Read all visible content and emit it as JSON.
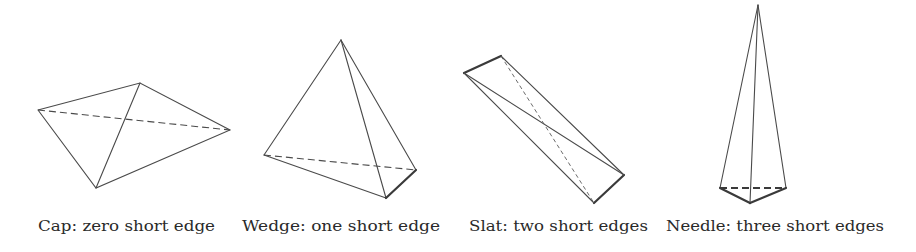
{
  "figure": {
    "panels": [
      {
        "id": "cap",
        "label": "Cap: zero short edge",
        "short_edges": 0,
        "vertices": {
          "A": [
            38,
            110
          ],
          "B": [
            140,
            83
          ],
          "C": [
            230,
            130
          ],
          "D": [
            96,
            188
          ]
        }
      },
      {
        "id": "wedge",
        "label": "Wedge: one short edge",
        "short_edges": 1,
        "vertices": {
          "apex": [
            341,
            40
          ],
          "left": [
            264,
            155
          ],
          "right": [
            416,
            170
          ],
          "bottom": [
            386,
            198
          ]
        }
      },
      {
        "id": "slat",
        "label": "Slat: two short edges",
        "short_edges": 2,
        "vertices": {
          "tl": [
            464,
            73
          ],
          "tr": [
            501,
            56
          ],
          "br": [
            624,
            175
          ],
          "bl": [
            594,
            203
          ]
        }
      },
      {
        "id": "needle",
        "label": "Needle: three short edges",
        "short_edges": 3,
        "vertices": {
          "apex": [
            758,
            5
          ],
          "left": [
            720,
            188
          ],
          "right": [
            786,
            188
          ],
          "bottom": [
            750,
            203
          ]
        }
      }
    ],
    "colors": {
      "line": "#4a4a4a",
      "text": "#2a2a2a",
      "background": "#ffffff"
    }
  }
}
